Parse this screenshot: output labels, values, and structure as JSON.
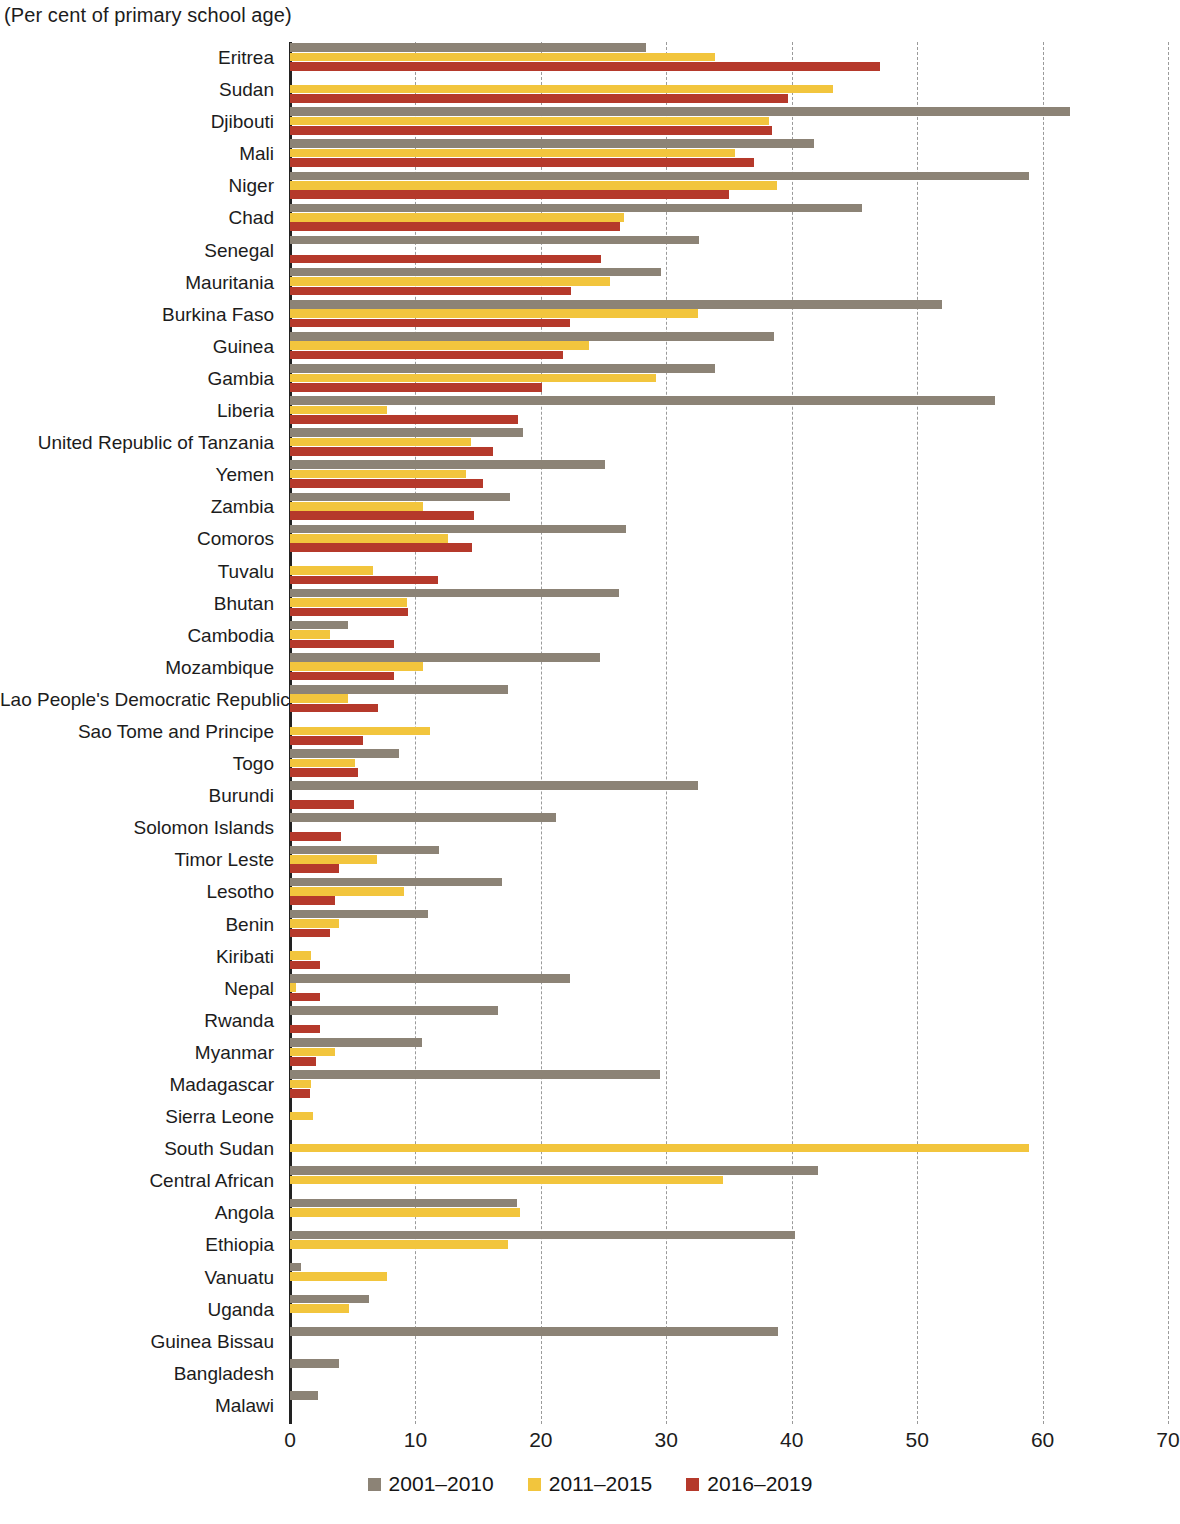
{
  "subtitle": "(Per cent of primary school age)",
  "legend": {
    "position": "bottom-center",
    "items": [
      {
        "label": "2001–2010",
        "color": "#8c8376"
      },
      {
        "label": "2011–2015",
        "color": "#f2c53d"
      },
      {
        "label": "2016–2019",
        "color": "#b5392b"
      }
    ]
  },
  "axis": {
    "ticks": [
      0,
      10,
      20,
      30,
      40,
      50,
      60,
      70
    ],
    "tick_labels": [
      "0",
      "10",
      "20",
      "30",
      "40",
      "50",
      "60",
      "70"
    ],
    "min": 0,
    "max": 70,
    "grid": true
  },
  "chart_data": {
    "type": "bar",
    "orientation": "horizontal",
    "title": "",
    "subtitle": "(Per cent of primary school age)",
    "xlabel": "",
    "ylabel": "",
    "xlim": [
      0,
      70
    ],
    "grid": true,
    "legend_position": "bottom-center",
    "categories": [
      "Eritrea",
      "Sudan",
      "Djibouti",
      "Mali",
      "Niger",
      "Chad",
      "Senegal",
      "Mauritania",
      "Burkina  Faso",
      "Guinea",
      "Gambia",
      "Liberia",
      "United Republic of Tanzania",
      "Yemen",
      "Zambia",
      "Comoros",
      "Tuvalu",
      "Bhutan",
      "Cambodia",
      "Mozambique",
      "Lao People's Democratic Republic",
      "Sao Tome and Principe",
      "Togo",
      "Burundi",
      "Solomon Islands",
      "Timor Leste",
      "Lesotho",
      "Benin",
      "Kiribati",
      "Nepal",
      "Rwanda",
      "Myanmar",
      "Madagascar",
      "Sierra Leone",
      "South Sudan",
      "Central African",
      "Angola",
      "Ethiopia",
      "Vanuatu",
      "Uganda",
      "Guinea Bissau",
      "Bangladesh",
      "Malawi"
    ],
    "series": [
      {
        "name": "2001–2010",
        "color": "#8c8376",
        "values": [
          28.4,
          null,
          62.2,
          41.8,
          58.9,
          45.6,
          32.6,
          29.6,
          52.0,
          38.6,
          33.9,
          56.2,
          18.6,
          25.1,
          17.5,
          26.8,
          null,
          26.2,
          4.6,
          24.7,
          17.4,
          null,
          8.7,
          32.5,
          21.2,
          11.9,
          16.9,
          11.0,
          null,
          22.3,
          16.6,
          10.5,
          29.5,
          null,
          null,
          42.1,
          18.1,
          40.3,
          0.9,
          6.3,
          38.9,
          3.9,
          2.2
        ]
      },
      {
        "name": "2011–2015",
        "color": "#f2c53d",
        "values": [
          33.9,
          43.3,
          38.2,
          35.5,
          38.8,
          26.6,
          null,
          25.5,
          32.5,
          23.8,
          29.2,
          7.7,
          14.4,
          14.0,
          10.6,
          12.6,
          6.6,
          9.3,
          3.2,
          10.6,
          4.6,
          11.2,
          5.2,
          null,
          null,
          6.9,
          9.1,
          3.9,
          1.7,
          0.5,
          null,
          3.6,
          1.7,
          1.8,
          58.9,
          34.5,
          18.3,
          17.4,
          7.7,
          4.7,
          null,
          null,
          null
        ]
      },
      {
        "name": "2016–2019",
        "color": "#b5392b",
        "values": [
          47.0,
          39.7,
          38.4,
          37.0,
          35.0,
          26.3,
          24.8,
          22.4,
          22.3,
          21.8,
          20.1,
          18.2,
          16.2,
          15.4,
          14.7,
          14.5,
          11.8,
          9.4,
          8.3,
          8.3,
          7.0,
          5.8,
          5.4,
          5.1,
          4.1,
          3.9,
          3.6,
          3.2,
          2.4,
          2.4,
          2.4,
          2.1,
          1.6,
          null,
          null,
          null,
          null,
          null,
          null,
          null,
          null,
          null,
          null
        ]
      }
    ]
  }
}
